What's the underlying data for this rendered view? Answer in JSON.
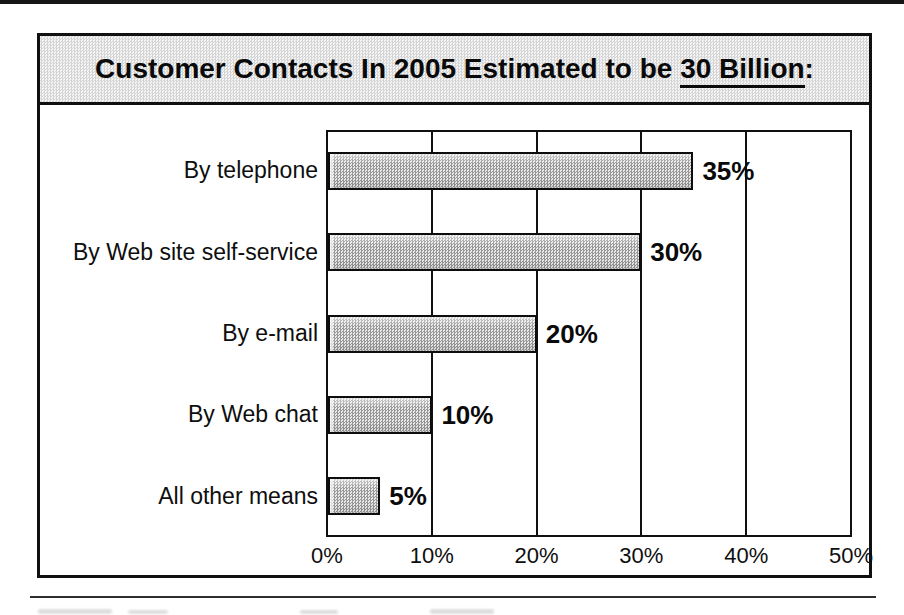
{
  "chart_data": {
    "type": "bar",
    "orientation": "horizontal",
    "title": {
      "prefix": "Customer Contacts In 2005 Estimated to be ",
      "underlined": "30 Billion",
      "suffix": ":"
    },
    "categories": [
      "By telephone",
      "By Web site self-service",
      "By e-mail",
      "By Web chat",
      "All other means"
    ],
    "values": [
      35,
      30,
      20,
      10,
      5
    ],
    "value_labels": [
      "35%",
      "30%",
      "20%",
      "10%",
      "5%"
    ],
    "xlabel": "",
    "ylabel": "",
    "xlim": [
      0,
      50
    ],
    "x_ticks": [
      0,
      10,
      20,
      30,
      40,
      50
    ],
    "x_tick_labels": [
      "0%",
      "10%",
      "20%",
      "30%",
      "40%",
      "50%"
    ],
    "grid": "vertical-only",
    "legend": "none",
    "colors": {
      "bar_fill": "#c6c6c6",
      "bar_border": "#0d0d0d",
      "line_color": "#101010",
      "title_bar_fill": "#e4e4e4",
      "background": "#ffffff"
    }
  }
}
